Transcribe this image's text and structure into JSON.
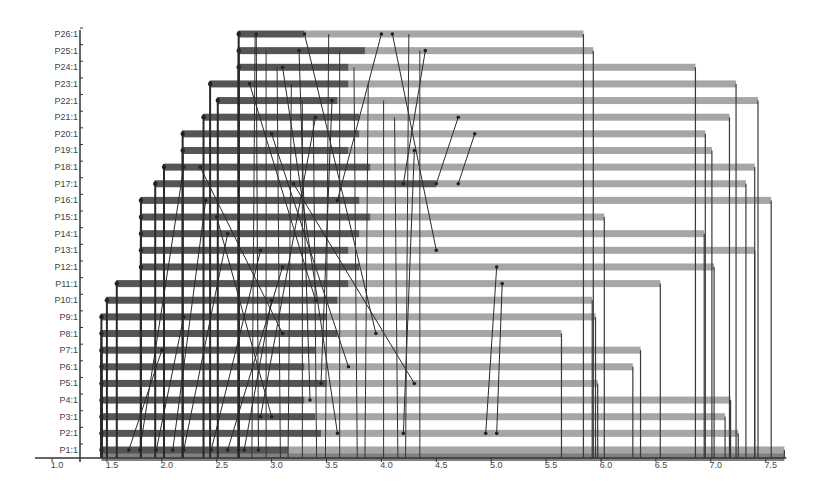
{
  "chart_data": {
    "type": "gantt-trace",
    "title": "",
    "xlabel": "",
    "ylabel": "",
    "xlim": [
      1.0,
      7.7
    ],
    "x_ticks": [
      "1.0",
      "1.5",
      "2.0",
      "2.5",
      "3.0",
      "3.5",
      "4.0",
      "4.5",
      "5.0",
      "5.5",
      "6.0",
      "6.5",
      "7.0",
      "7.5"
    ],
    "x_tick_values": [
      1.0,
      1.5,
      2.0,
      2.5,
      3.0,
      3.5,
      4.0,
      4.5,
      5.0,
      5.5,
      6.0,
      6.5,
      7.0,
      7.5
    ],
    "grid": false,
    "legend": null,
    "colors": {
      "bar_dark": "#555555",
      "bar_light": "#a6a6a6",
      "axis": "#333333",
      "message_line": "#2a2a2a",
      "label": "#444444"
    },
    "rows": [
      {
        "label": "P1:1",
        "start": 1.45,
        "dark_end": 3.15,
        "end": 7.67
      },
      {
        "label": "P2:1",
        "start": 1.45,
        "dark_end": 3.45,
        "end": 7.25
      },
      {
        "label": "P3:1",
        "start": 1.45,
        "dark_end": 3.4,
        "end": 7.13
      },
      {
        "label": "P4:1",
        "start": 1.45,
        "dark_end": 3.3,
        "end": 7.18
      },
      {
        "label": "P5:1",
        "start": 1.45,
        "dark_end": 3.5,
        "end": 5.97
      },
      {
        "label": "P6:1",
        "start": 1.45,
        "dark_end": 3.3,
        "end": 6.29
      },
      {
        "label": "P7:1",
        "start": 1.45,
        "dark_end": 3.4,
        "end": 6.36
      },
      {
        "label": "P8:1",
        "start": 1.45,
        "dark_end": 3.6,
        "end": 5.64
      },
      {
        "label": "P9:1",
        "start": 1.45,
        "dark_end": 3.5,
        "end": 5.95
      },
      {
        "label": "P10:1",
        "start": 1.5,
        "dark_end": 3.6,
        "end": 5.92
      },
      {
        "label": "P11:1",
        "start": 1.59,
        "dark_end": 3.7,
        "end": 6.54
      },
      {
        "label": "P12:1",
        "start": 1.81,
        "dark_end": 3.8,
        "end": 7.03
      },
      {
        "label": "P13:1",
        "start": 1.81,
        "dark_end": 3.7,
        "end": 7.4
      },
      {
        "label": "P14:1",
        "start": 1.81,
        "dark_end": 3.8,
        "end": 6.94
      },
      {
        "label": "P15:1",
        "start": 1.81,
        "dark_end": 3.9,
        "end": 6.03
      },
      {
        "label": "P16:1",
        "start": 1.81,
        "dark_end": 3.8,
        "end": 7.55
      },
      {
        "label": "P17:1",
        "start": 1.94,
        "dark_end": 4.5,
        "end": 7.32
      },
      {
        "label": "P18:1",
        "start": 2.02,
        "dark_end": 3.9,
        "end": 7.4
      },
      {
        "label": "P19:1",
        "start": 2.19,
        "dark_end": 3.7,
        "end": 7.01
      },
      {
        "label": "P20:1",
        "start": 2.19,
        "dark_end": 3.8,
        "end": 6.95
      },
      {
        "label": "P21:1",
        "start": 2.38,
        "dark_end": 3.8,
        "end": 7.17
      },
      {
        "label": "P22:1",
        "start": 2.51,
        "dark_end": 3.6,
        "end": 7.43
      },
      {
        "label": "P23:1",
        "start": 2.44,
        "dark_end": 3.7,
        "end": 7.23
      },
      {
        "label": "P24:1",
        "start": 2.7,
        "dark_end": 3.7,
        "end": 6.86
      },
      {
        "label": "P25:1",
        "start": 2.7,
        "dark_end": 3.85,
        "end": 5.93
      },
      {
        "label": "P26:1",
        "start": 2.7,
        "dark_end": 3.3,
        "end": 5.84
      }
    ],
    "messages": [
      {
        "from_row": 26,
        "to_row": 1,
        "x1": 2.7,
        "x2": 2.7
      },
      {
        "from_row": 26,
        "to_row": 1,
        "x1": 2.86,
        "x2": 2.88
      },
      {
        "from_row": 25,
        "to_row": 4,
        "x1": 3.25,
        "x2": 3.35
      },
      {
        "from_row": 26,
        "to_row": 8,
        "x1": 3.3,
        "x2": 3.95
      },
      {
        "from_row": 24,
        "to_row": 2,
        "x1": 3.1,
        "x2": 3.6
      },
      {
        "from_row": 22,
        "to_row": 5,
        "x1": 3.55,
        "x2": 3.45
      },
      {
        "from_row": 21,
        "to_row": 3,
        "x1": 3.4,
        "x2": 2.9
      },
      {
        "from_row": 20,
        "to_row": 6,
        "x1": 3.0,
        "x2": 3.7
      },
      {
        "from_row": 26,
        "to_row": 16,
        "x1": 4.0,
        "x2": 3.6
      },
      {
        "from_row": 26,
        "to_row": 13,
        "x1": 4.1,
        "x2": 4.5
      },
      {
        "from_row": 25,
        "to_row": 17,
        "x1": 4.4,
        "x2": 4.2
      },
      {
        "from_row": 21,
        "to_row": 17,
        "x1": 4.7,
        "x2": 4.5
      },
      {
        "from_row": 20,
        "to_row": 17,
        "x1": 4.85,
        "x2": 4.7
      },
      {
        "from_row": 17,
        "to_row": 5,
        "x1": 3.2,
        "x2": 4.3
      },
      {
        "from_row": 19,
        "to_row": 2,
        "x1": 4.3,
        "x2": 4.2
      },
      {
        "from_row": 12,
        "to_row": 2,
        "x1": 5.05,
        "x2": 4.95
      },
      {
        "from_row": 11,
        "to_row": 2,
        "x1": 5.1,
        "x2": 5.05
      },
      {
        "from_row": 18,
        "to_row": 1,
        "x1": 2.2,
        "x2": 1.8
      },
      {
        "from_row": 16,
        "to_row": 1,
        "x1": 2.4,
        "x2": 2.1
      },
      {
        "from_row": 14,
        "to_row": 1,
        "x1": 2.6,
        "x2": 2.2
      },
      {
        "from_row": 13,
        "to_row": 1,
        "x1": 2.9,
        "x2": 2.45
      },
      {
        "from_row": 12,
        "to_row": 1,
        "x1": 3.1,
        "x2": 2.6
      },
      {
        "from_row": 10,
        "to_row": 1,
        "x1": 3.0,
        "x2": 2.75
      },
      {
        "from_row": 15,
        "to_row": 3,
        "x1": 2.5,
        "x2": 3.0
      },
      {
        "from_row": 18,
        "to_row": 8,
        "x1": 2.35,
        "x2": 3.1
      },
      {
        "from_row": 23,
        "to_row": 10,
        "x1": 2.8,
        "x2": 3.4
      },
      {
        "from_row": 9,
        "to_row": 1,
        "x1": 2.2,
        "x2": 1.95
      },
      {
        "from_row": 7,
        "to_row": 1,
        "x1": 2.0,
        "x2": 1.7
      }
    ]
  }
}
